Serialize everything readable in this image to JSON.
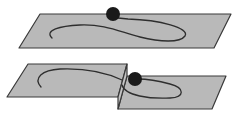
{
  "figure": {
    "colors": {
      "plane_fill": "#b9b9b9",
      "step_fill": "#c4c4c4",
      "outline": "#3a3a3a",
      "curve": "#2e2e2e",
      "ball": "#1a1a1a",
      "background": "#ffffff"
    },
    "top_panel": {
      "plane_points": "40,14 231,14 214,48 19,48",
      "curve_path": "M 52,38 C 44,30 60,26 80,25 C 105,24 120,32 140,37 C 160,42 180,43 185,36 C 190,28 160,20 128,19 L 118,18",
      "ball": {
        "cx": 113,
        "cy": 14,
        "r": 7
      }
    },
    "bottom_panel": {
      "left_plane_points": "28,64 127,64 118,97 7,97",
      "step_face_points": "118,97 127,64 127,76 118,109",
      "right_plane_points": "127,76 226,76 212,109 118,109",
      "left_curve_path": "M 41,87 C 33,78 42,70 60,69 C 85,68 105,72 122,80",
      "right_curve_path": "M 122,85 C 125,96 150,99 170,98 C 185,97 185,88 170,84 C 155,80 142,79 138,79",
      "ball": {
        "cx": 135,
        "cy": 79,
        "r": 7
      }
    }
  }
}
